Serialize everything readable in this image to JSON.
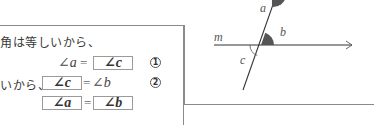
{
  "explanation": {
    "line1_text": "角は等しいから、",
    "line2": {
      "left": "∠a",
      "equals": "=",
      "answer": "∠c",
      "marker": "1"
    },
    "line3": {
      "prefix": "いから、",
      "answer": "∠c",
      "equals": "=",
      "right": "∠b",
      "marker": "2"
    },
    "line4": {
      "answer_left": "∠a",
      "equals": "=",
      "answer_right": "∠b"
    }
  },
  "diagram": {
    "line_label": "m",
    "angle_labels": {
      "a": "a",
      "b": "b",
      "c": "c"
    },
    "colors": {
      "line": "#333333",
      "shaded_angle": "#555555",
      "frame": "#8a8a8a"
    }
  }
}
